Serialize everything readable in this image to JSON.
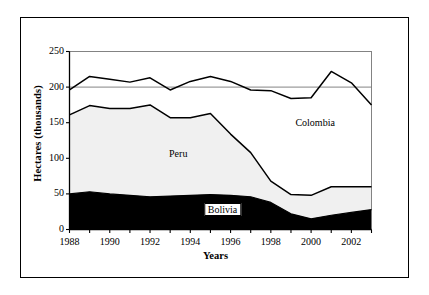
{
  "chart_data": {
    "type": "area",
    "stacked": true,
    "title": "",
    "xlabel": "Years",
    "ylabel": "Hectares (thousands)",
    "x": [
      1988,
      1989,
      1990,
      1991,
      1992,
      1993,
      1994,
      1995,
      1996,
      1997,
      1998,
      1999,
      2000,
      2001,
      2002,
      2003
    ],
    "xlim": [
      1988,
      2003
    ],
    "ylim": [
      0,
      250
    ],
    "xticks": [
      1988,
      1990,
      1992,
      1994,
      1996,
      1998,
      2000,
      2002
    ],
    "xtick_labels": [
      "1988",
      "1990",
      "1992",
      "1994",
      "1996",
      "1998",
      "2000",
      "2002"
    ],
    "yticks": [
      0,
      50,
      100,
      150,
      200,
      250
    ],
    "ytick_labels": [
      "0",
      "50",
      "100",
      "150",
      "200",
      "250"
    ],
    "grid": false,
    "legend_position": "inline-annotations",
    "series": [
      {
        "name": "Bolivia",
        "fill": "#000000",
        "values": [
          50,
          53,
          50,
          48,
          46,
          47,
          48,
          49,
          48,
          46,
          38,
          22,
          15,
          20,
          24,
          28
        ]
      },
      {
        "name": "Peru",
        "fill": "#f0f0f0",
        "values": [
          111,
          121,
          120,
          122,
          129,
          110,
          109,
          114,
          86,
          62,
          30,
          27,
          33,
          40,
          36,
          32
        ]
      },
      {
        "name": "Colombia",
        "fill": "#ffffff",
        "values": [
          35,
          41,
          41,
          37,
          38,
          39,
          51,
          52,
          74,
          88,
          127,
          135,
          137,
          162,
          146,
          115
        ]
      }
    ],
    "cumulative_totals": {
      "bolivia_top": [
        50,
        53,
        50,
        48,
        46,
        47,
        48,
        49,
        48,
        46,
        38,
        22,
        15,
        20,
        24,
        28
      ],
      "peru_top": [
        161,
        174,
        170,
        170,
        175,
        157,
        157,
        163,
        134,
        108,
        68,
        49,
        48,
        60,
        60,
        60
      ],
      "colombia_top": [
        196,
        215,
        211,
        207,
        213,
        196,
        208,
        215,
        208,
        196,
        195,
        184,
        185,
        222,
        206,
        175
      ]
    },
    "annotations": [
      {
        "text": "Colombia",
        "x_year": 2000.2,
        "y_value": 148,
        "boxed": false
      },
      {
        "text": "Peru",
        "x_year": 1993.4,
        "y_value": 104,
        "boxed": false
      },
      {
        "text": "Bolivia",
        "x_year": 1995.6,
        "y_value": 27,
        "boxed": true
      }
    ]
  }
}
